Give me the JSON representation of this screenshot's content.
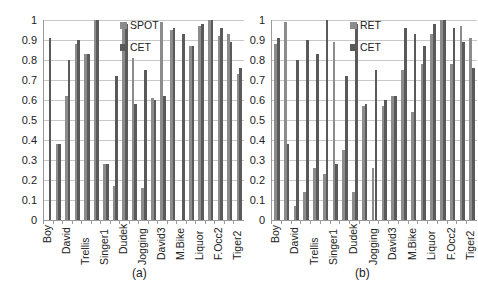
{
  "chart_data": [
    {
      "type": "bar",
      "id": "a",
      "caption": "(a)",
      "categories": [
        "Boy",
        "",
        "David",
        "",
        "Trellis",
        "",
        "Singer1",
        "",
        "Dudek",
        "",
        "Jogging",
        "",
        "David3",
        "",
        "M.Bike",
        "",
        "Liquor",
        "",
        "F.Occ2",
        "",
        "Tiger2"
      ],
      "series": [
        {
          "name": "SPOT",
          "color": "#8c8c8c",
          "values": [
            0.0,
            0.38,
            0.62,
            0.88,
            0.83,
            1.0,
            0.28,
            0.17,
            0.97,
            0.81,
            0.16,
            0.61,
            0.99,
            0.95,
            0.0,
            0.87,
            0.97,
            1.0,
            0.92,
            0.93,
            0.73
          ]
        },
        {
          "name": "CET",
          "color": "#5a5a5a",
          "values": [
            0.91,
            0.38,
            0.8,
            0.9,
            0.83,
            1.0,
            0.28,
            0.72,
            0.98,
            0.58,
            0.75,
            0.6,
            0.62,
            0.96,
            0.93,
            0.87,
            0.98,
            1.0,
            0.96,
            0.89,
            0.76
          ]
        }
      ],
      "extra_last_bar": {
        "series": "SPOT",
        "value": 0.99,
        "label_extra": "",
        "note": "rightmost bar pair partially shown"
      },
      "yticks": [
        "0",
        "0.1",
        "0.2",
        "0.3",
        "0.4",
        "0.5",
        "0.6",
        "0.7",
        "0.8",
        "0.9",
        "1"
      ],
      "ylim": [
        0,
        1
      ],
      "xlabel": "",
      "ylabel": "",
      "grid": true,
      "legend_position": "top-center-inside"
    },
    {
      "type": "bar",
      "id": "b",
      "caption": "(b)",
      "categories": [
        "Boy",
        "",
        "David",
        "",
        "Trellis",
        "",
        "Singer1",
        "",
        "Dudek",
        "",
        "Jogging",
        "",
        "David3",
        "",
        "M.Bike",
        "",
        "Liquor",
        "",
        "F.Occ2",
        "",
        "Tiger2"
      ],
      "series": [
        {
          "name": "RET",
          "color": "#8c8c8c",
          "values": [
            0.88,
            0.99,
            0.07,
            0.14,
            0.26,
            0.23,
            0.89,
            0.35,
            0.14,
            0.57,
            0.26,
            0.57,
            0.62,
            0.75,
            0.54,
            0.78,
            0.93,
            1.0,
            0.78,
            0.97,
            0.91
          ]
        },
        {
          "name": "CET",
          "color": "#5a5a5a",
          "values": [
            0.91,
            0.38,
            0.8,
            0.9,
            0.83,
            1.0,
            0.28,
            0.72,
            0.98,
            0.58,
            0.75,
            0.6,
            0.62,
            0.96,
            0.93,
            0.87,
            0.98,
            1.0,
            0.96,
            0.89,
            0.76
          ]
        }
      ],
      "yticks": [
        "0",
        "0.1",
        "0.2",
        "0.3",
        "0.4",
        "0.5",
        "0.6",
        "0.7",
        "0.8",
        "0.9",
        "1"
      ],
      "ylim": [
        0,
        1
      ],
      "xlabel": "",
      "ylabel": "",
      "grid": true,
      "legend_position": "top-center-inside"
    }
  ]
}
